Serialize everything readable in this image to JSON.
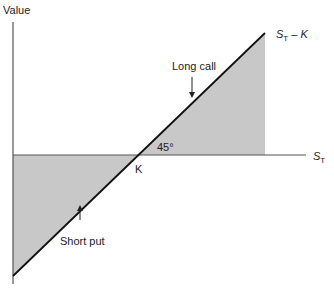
{
  "diagram": {
    "y_axis_label": "Value",
    "x_axis_label": {
      "base": "S",
      "sub": "T"
    },
    "line_label": {
      "base": "S",
      "sub": "T",
      "rest": " – K"
    },
    "strike_label": "K",
    "angle_label": "45°",
    "annotations": [
      {
        "text": "Long call"
      },
      {
        "text": "Short put"
      }
    ],
    "colors": {
      "shade": "#c8c8c8",
      "line": "#111111",
      "axis": "#555555"
    }
  }
}
